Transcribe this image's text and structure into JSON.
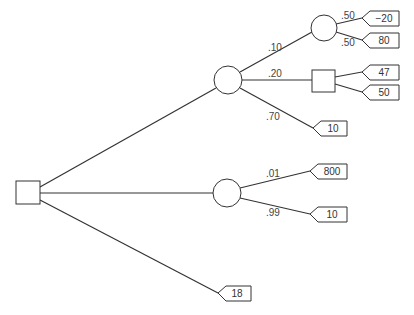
{
  "diagram": {
    "type": "decision-tree",
    "root": {
      "kind": "decision",
      "label": "root"
    },
    "branches": {
      "b1": {
        "node": "chance",
        "probs": {
          "p1": ".10",
          "p2": ".20",
          "p3": ".70"
        },
        "sub_chance": {
          "probs": {
            "a": ".50",
            "b": ".50"
          },
          "payoffs": {
            "a": "−20",
            "b": "80"
          }
        },
        "sub_decision": {
          "payoffs": {
            "a": "47",
            "b": "50"
          }
        },
        "payoff_p3": "10"
      },
      "b2": {
        "node": "chance",
        "probs": {
          "p1": ".01",
          "p2": ".99"
        },
        "payoffs": {
          "p1": "800",
          "p2": "10"
        }
      },
      "b3": {
        "payoff": "18"
      }
    }
  }
}
